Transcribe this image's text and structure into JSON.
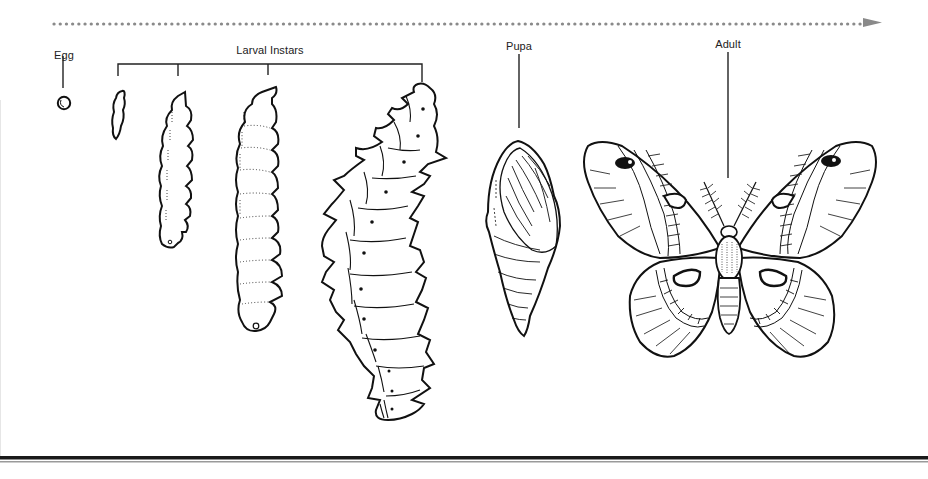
{
  "diagram": {
    "timeline": {
      "style": "dotted-arrow",
      "color": "#888888",
      "direction": "left-to-right"
    },
    "stages": [
      {
        "id": "egg",
        "label": "Egg",
        "label_x": 57,
        "label_y": 47
      },
      {
        "id": "larva",
        "label": "Larval Instars",
        "label_x": 270,
        "label_y": 45,
        "instar_count": 4
      },
      {
        "id": "pupa",
        "label": "Pupa",
        "label_x": 519,
        "label_y": 42
      },
      {
        "id": "adult",
        "label": "Adult",
        "label_x": 728,
        "label_y": 40
      }
    ],
    "colors": {
      "ink": "#111111",
      "dots": "#888888",
      "rule_dark": "#1a1a1a",
      "rule_light": "#9a9a9a"
    }
  }
}
